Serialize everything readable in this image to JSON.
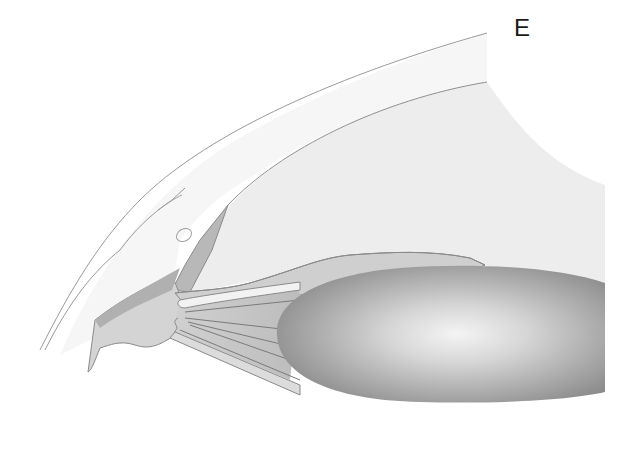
{
  "figure": {
    "panel_label": "E",
    "colors": {
      "background": "#ffffff",
      "cornea_band": "#f4f4f4",
      "anterior_chamber": "#ececec",
      "outline": "#8a8a8a",
      "tissue_mid": "#c8c8c8",
      "tissue_dark": "#a8a8a8",
      "lens_edge": "#8f8f8f",
      "lens_center": "#f2f2f2",
      "label_text": "#1a1a1a"
    }
  }
}
